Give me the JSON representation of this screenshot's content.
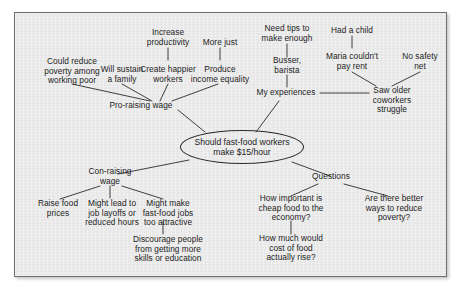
{
  "diagram": {
    "type": "mind-map",
    "colors": {
      "panel_background": "#e9e9e9",
      "page_background": "#ffffff",
      "border": "#6e6e6e",
      "text": "#1d1d1d",
      "line": "#2a2a2a"
    },
    "central": {
      "label": "Should fast-food workers\nmake $15/hour"
    },
    "branches": [
      {
        "key": "pro",
        "label": "Pro-raising wage",
        "children": [
          {
            "key": "could-reduce-poverty",
            "label": "Could reduce\npoverty among\nworking poor"
          },
          {
            "key": "will-sustain-family",
            "label": "Will sustain\na family"
          },
          {
            "key": "create-happier-workers",
            "label": "Create happier\nworkers",
            "children": [
              {
                "key": "increase-productivity",
                "label": "Increase\nproductivity"
              }
            ]
          },
          {
            "key": "produce-income-equality",
            "label": "Produce\nincome equality",
            "children": [
              {
                "key": "more-just",
                "label": "More just"
              }
            ]
          }
        ]
      },
      {
        "key": "experiences",
        "label": "My experiences",
        "children": [
          {
            "key": "busser-barista",
            "label": "Busser,\nbarista",
            "children": [
              {
                "key": "need-tips",
                "label": "Need tips to\nmake enough"
              }
            ]
          },
          {
            "key": "saw-older-coworkers-struggle",
            "label": "Saw older\ncoworkers\nstruggle",
            "children": [
              {
                "key": "maria-couldnt-pay-rent",
                "label": "Maria couldn't\npay rent"
              },
              {
                "key": "no-safety-net",
                "label": "No safety\nnet"
              }
            ]
          },
          {
            "key": "had-a-child",
            "label": "Had a child"
          }
        ]
      },
      {
        "key": "con",
        "label": "Con-raising\nwage",
        "children": [
          {
            "key": "raise-food-prices",
            "label": "Raise food\nprices"
          },
          {
            "key": "job-layoffs",
            "label": "Might lead to\njob layoffs or\nreduced hours"
          },
          {
            "key": "too-attractive",
            "label": "Might make\nfast-food jobs\ntoo attractive",
            "children": [
              {
                "key": "discourage-people",
                "label": "Discourage people\nfrom getting more\nskills or education"
              }
            ]
          }
        ]
      },
      {
        "key": "questions",
        "label": "Questions",
        "children": [
          {
            "key": "cheap-food-economy",
            "label": "How important is\ncheap food to the\neconomy?",
            "children": [
              {
                "key": "cost-of-food-rise",
                "label": "How much would\ncost of food\nactually rise?"
              }
            ]
          },
          {
            "key": "better-ways-reduce-poverty",
            "label": "Are there better\nways to reduce\npoverty?"
          }
        ]
      }
    ]
  }
}
